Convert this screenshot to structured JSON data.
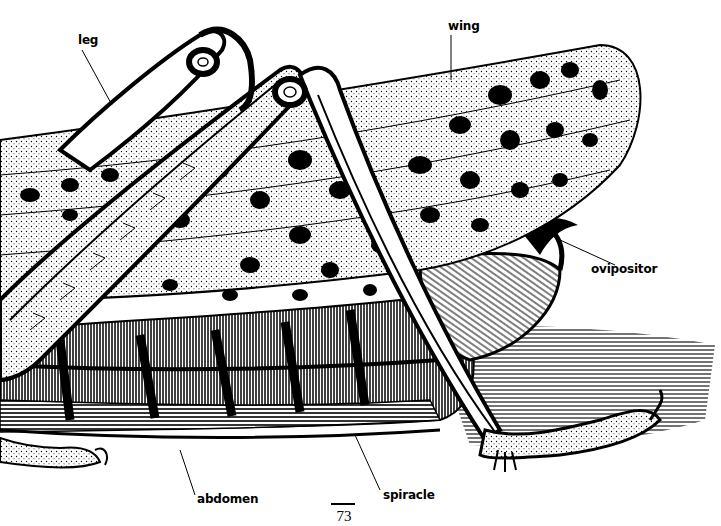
{
  "figure": {
    "labels": {
      "leg": "leg",
      "wing": "wing",
      "ovipositor": "ovipositor",
      "abdomen": "abdomen",
      "spiracle": "spiracle"
    },
    "page_number": "73",
    "colors": {
      "ink": "#000000",
      "paper": "#ffffff"
    }
  }
}
